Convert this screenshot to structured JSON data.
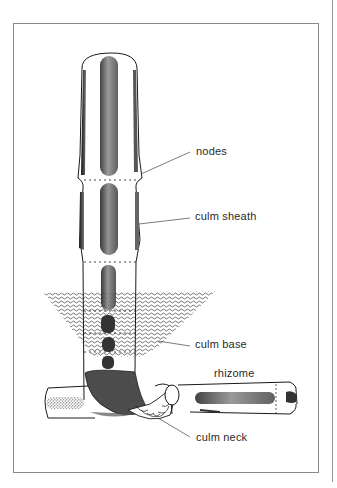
{
  "figure": {
    "labels": {
      "nodes": "nodes",
      "culm_sheath": "culm sheath",
      "culm_base": "culm base",
      "rhizome": "rhizome",
      "culm_neck": "culm neck"
    },
    "colors": {
      "ink": "#1a1a1a",
      "frame": "#8a8a8a",
      "label_text": "#2a2a2a",
      "soil": "#3a3a3a"
    }
  }
}
